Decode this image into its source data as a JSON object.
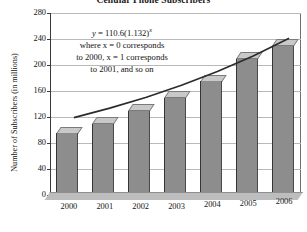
{
  "chart_data": {
    "type": "bar",
    "title": "Cellular Phone Subscribers",
    "xlabel": "",
    "ylabel": "Number of Subscribers (in millions)",
    "categories": [
      "2000",
      "2001",
      "2002",
      "2003",
      "2004",
      "2005",
      "2006"
    ],
    "values": [
      95,
      110,
      130,
      150,
      175,
      210,
      230
    ],
    "ylim": [
      0,
      280
    ],
    "ytick_labels": [
      "0",
      "40",
      "80",
      "120",
      "160",
      "200",
      "240",
      "280"
    ],
    "ytick_values": [
      0,
      40,
      80,
      120,
      160,
      200,
      240,
      280
    ],
    "grid": true,
    "legend": "none",
    "series": [
      {
        "name": "Subscribers",
        "values": [
          95,
          110,
          130,
          150,
          175,
          210,
          230
        ]
      }
    ],
    "overlay": {
      "type": "line",
      "name": "Exponential model",
      "equation": "y = 110.6(1.132)^x",
      "values": [
        110.6,
        125.2,
        141.7,
        160.4,
        181.6,
        205.5,
        232.7
      ]
    },
    "annotation": {
      "line1_prefix": "y",
      "line1_eq": " = 110.6(1.132)",
      "line1_exp": "x",
      "line2": "where x = 0 corresponds",
      "line3": "to 2000, x = 1 corresponds",
      "line4": "to 2001, and so on"
    }
  },
  "colors": {
    "bar_front": "#8d8d8d",
    "bar_top": "#c9c9c9",
    "trend_line": "#2b2b2b",
    "gridline": "#b9b9b9",
    "axis": "#3a3a3a",
    "floor": "#bdbdbd",
    "text": "#141414"
  }
}
